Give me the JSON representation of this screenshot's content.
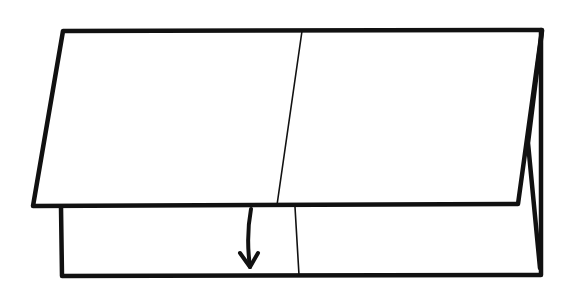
{
  "diagram": {
    "type": "origami-fold-step",
    "colors": {
      "stroke": "#111111",
      "background": "#ffffff"
    },
    "elements": {
      "upper_flap": {
        "points": [
          [
            63,
            31
          ],
          [
            542,
            30
          ],
          [
            518,
            204
          ],
          [
            33,
            206
          ]
        ]
      },
      "upper_crease": {
        "from": [
          302,
          31
        ],
        "to": [
          277,
          205
        ]
      },
      "lower_panel": {
        "points": [
          [
            61,
            207
          ],
          [
            61,
            276
          ],
          [
            541,
            275
          ],
          [
            541,
            30
          ]
        ]
      },
      "lower_crease": {
        "from": [
          295,
          207
        ],
        "to": [
          299,
          275
        ]
      },
      "right_fold_layer": {
        "points": [
          [
            542,
            30
          ],
          [
            528,
            143
          ],
          [
            541,
            268
          ]
        ]
      },
      "fold_arrow": {
        "direction": "down",
        "from": [
          250,
          208
        ],
        "to": [
          250,
          268
        ]
      }
    }
  }
}
